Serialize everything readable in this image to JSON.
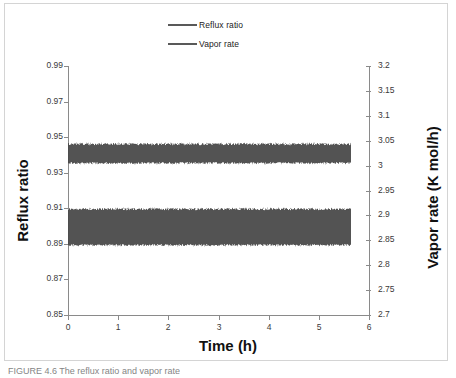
{
  "figure": {
    "caption": "FIGURE 4.6  The reflux ratio and vapor rate",
    "background_color": "#ffffff",
    "frame_color": "#d4d4d4"
  },
  "legend": {
    "position": "top-center",
    "entries": [
      {
        "label": "Reflux ratio",
        "color": "#595959"
      },
      {
        "label": "Vapor rate",
        "color": "#595959"
      }
    ]
  },
  "axes": {
    "x": {
      "title": "Time (h)",
      "ticks": [
        "0",
        "1",
        "2",
        "3",
        "4",
        "5",
        "6"
      ],
      "min": 0,
      "max": 6
    },
    "y_left": {
      "title": "Reflux ratio",
      "ticks": [
        "0.85",
        "0.87",
        "0.89",
        "0.91",
        "0.93",
        "0.95",
        "0.97",
        "0.99"
      ],
      "min": 0.85,
      "max": 0.99
    },
    "y_right": {
      "title": "Vapor rate (K mol/h)",
      "ticks": [
        "2.7",
        "2.75",
        "2.8",
        "2.85",
        "2.9",
        "2.95",
        "3",
        "3.05",
        "3.1",
        "3.15",
        "3.2"
      ],
      "min": 2.7,
      "max": 3.2
    }
  },
  "chart_data": {
    "type": "line",
    "title": "",
    "subtitle": "",
    "xlabel": "Time (h)",
    "ylabel": "Reflux ratio",
    "y2label": "Vapor rate (K mol/h)",
    "xlim": [
      0,
      6
    ],
    "ylim": [
      0.85,
      0.99
    ],
    "y2lim": [
      2.7,
      3.2
    ],
    "grid": false,
    "legend_position": "top-center",
    "x_ticks": [
      0,
      1,
      2,
      3,
      4,
      5,
      6
    ],
    "y_left_ticks": [
      0.85,
      0.87,
      0.89,
      0.91,
      0.93,
      0.95,
      0.97,
      0.99
    ],
    "y_right_ticks": [
      2.7,
      2.75,
      2.8,
      2.85,
      2.9,
      2.95,
      3.0,
      3.05,
      3.1,
      3.15,
      3.2
    ],
    "x_data_start": 0.0,
    "x_data_end": 5.65,
    "series": [
      {
        "name": "Reflux ratio",
        "axis": "left",
        "color": "#4a4a4a",
        "style": "high-frequency noise band",
        "mean": 0.9,
        "band_min": 0.8895,
        "band_max": 0.9105,
        "note": "Oscillates rapidly between approximately 0.89 and 0.91 for the full 5.65 h run"
      },
      {
        "name": "Vapor rate",
        "axis": "right",
        "color": "#4a4a4a",
        "style": "high-frequency noise band",
        "mean": 3.025,
        "band_min": 3.005,
        "band_max": 3.047,
        "note": "Oscillates rapidly between approximately 3.005 and 3.047 K mol/h; drawn on the left scale this band spans about 0.934 to 0.9485"
      }
    ]
  }
}
